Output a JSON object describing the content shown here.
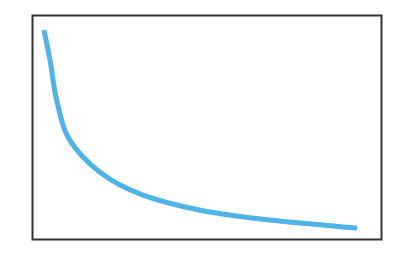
{
  "chart_data": {
    "type": "line",
    "title": "",
    "xlabel": "",
    "ylabel": "",
    "grid": false,
    "legend": null,
    "axes_ticks_visible": false,
    "series": [
      {
        "name": "curve",
        "color": "#4fb3ea",
        "x": [
          0.0,
          0.02,
          0.04,
          0.08,
          0.18,
          0.31,
          0.5,
          0.72,
          1.0
        ],
        "y": [
          1.0,
          0.84,
          0.65,
          0.45,
          0.28,
          0.17,
          0.09,
          0.04,
          0.0
        ]
      }
    ],
    "xlim": [
      0,
      1
    ],
    "ylim": [
      0,
      1
    ]
  },
  "style": {
    "frame_color": "#333333",
    "line_color": "#4fb3ea",
    "background": "#ffffff"
  }
}
